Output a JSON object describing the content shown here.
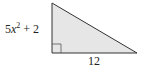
{
  "figure": {
    "type": "right-triangle",
    "fill_color": "#e6e6e6",
    "stroke_color": "#333333",
    "labels": {
      "vertical_leg_coef": "5",
      "vertical_leg_var": "x",
      "vertical_leg_exp": "2",
      "vertical_leg_rest": " + 2",
      "horizontal_leg": "12"
    },
    "right_angle_marker": true
  }
}
